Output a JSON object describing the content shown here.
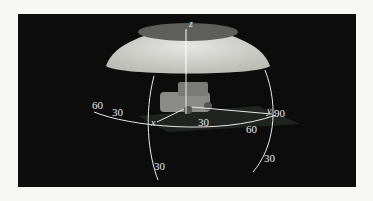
{
  "figure": {
    "colors": {
      "background": "#0c0c0c",
      "page": "#f7f7f5",
      "dome": "#d9d9d6",
      "lines": "#e8e8e8"
    },
    "axes": {
      "z": "z",
      "x": "x",
      "y": "y"
    },
    "labels": {
      "horiz_left_60": "60",
      "horiz_left_30": "30",
      "horiz_front_30": "30",
      "horiz_right_60": "60",
      "horiz_right_90": "90",
      "vert_left_30": "30",
      "vert_right_30": "30"
    }
  }
}
